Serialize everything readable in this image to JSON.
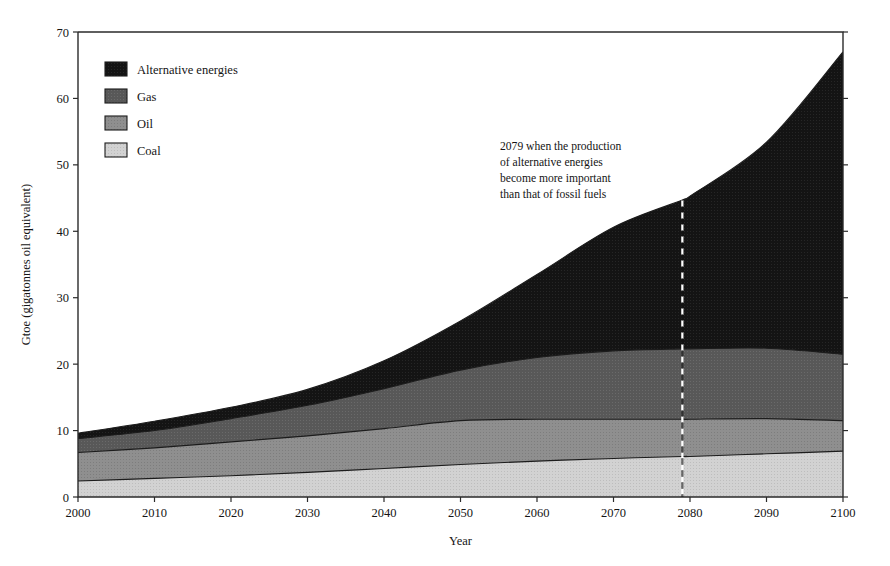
{
  "chart_data": {
    "type": "area",
    "stacked": true,
    "title": "",
    "xlabel": "Year",
    "ylabel": "Gtoe (gigatonnes oil equivalent)",
    "xlim": [
      2000,
      2100
    ],
    "ylim": [
      0,
      70
    ],
    "xticks": [
      2000,
      2010,
      2020,
      2030,
      2040,
      2050,
      2060,
      2070,
      2080,
      2090,
      2100
    ],
    "yticks": [
      0,
      10,
      20,
      30,
      40,
      50,
      60,
      70
    ],
    "grid": false,
    "legend_position": "top-left",
    "x": [
      2000,
      2010,
      2020,
      2030,
      2040,
      2050,
      2060,
      2070,
      2079,
      2080,
      2090,
      2100
    ],
    "series": [
      {
        "name": "Coal",
        "color": "#cccccc",
        "values": [
          2.4,
          2.8,
          3.2,
          3.7,
          4.3,
          4.9,
          5.4,
          5.8,
          6.1,
          6.1,
          6.5,
          6.9
        ]
      },
      {
        "name": "Oil",
        "color": "#8a8a8a",
        "values": [
          4.3,
          4.6,
          5.1,
          5.5,
          6.0,
          6.6,
          6.3,
          5.9,
          5.6,
          5.6,
          5.3,
          4.6
        ]
      },
      {
        "name": "Gas",
        "color": "#555555",
        "values": [
          2.1,
          2.6,
          3.5,
          4.6,
          6.0,
          7.6,
          9.3,
          10.3,
          10.6,
          10.6,
          10.6,
          10.0
        ]
      },
      {
        "name": "Alternative energies",
        "color": "#1a1a1a",
        "values": [
          0.8,
          1.4,
          1.7,
          2.4,
          4.2,
          7.4,
          12.5,
          18.6,
          22.4,
          23.0,
          31.0,
          45.5
        ]
      }
    ],
    "cumulative_tops": {
      "coal": [
        2.4,
        2.8,
        3.2,
        3.7,
        4.3,
        4.9,
        5.4,
        5.8,
        6.1,
        6.1,
        6.5,
        6.9
      ],
      "oil": [
        6.7,
        7.4,
        8.3,
        9.2,
        10.3,
        11.5,
        11.7,
        11.7,
        11.7,
        11.7,
        11.8,
        11.5
      ],
      "gas": [
        8.8,
        10.0,
        11.8,
        13.8,
        16.3,
        19.1,
        21.0,
        22.0,
        22.3,
        22.3,
        22.4,
        21.5
      ],
      "total": [
        9.6,
        11.4,
        13.5,
        16.2,
        20.5,
        26.5,
        33.5,
        40.6,
        44.7,
        45.3,
        53.4,
        67.0
      ]
    },
    "annotations": [
      {
        "name": "crossover-note",
        "lines": [
          "2079 when the production",
          "of alternative energies",
          "become more important",
          "than that of fossil fuels"
        ],
        "marker_year": 2079,
        "marker_value_top": 44.7,
        "marker_style": "dashed-vertical"
      }
    ],
    "legend": [
      {
        "label": "Alternative energies",
        "color": "#1a1a1a"
      },
      {
        "label": "Gas",
        "color": "#555555"
      },
      {
        "label": "Oil",
        "color": "#8a8a8a"
      },
      {
        "label": "Coal",
        "color": "#cccccc"
      }
    ]
  }
}
